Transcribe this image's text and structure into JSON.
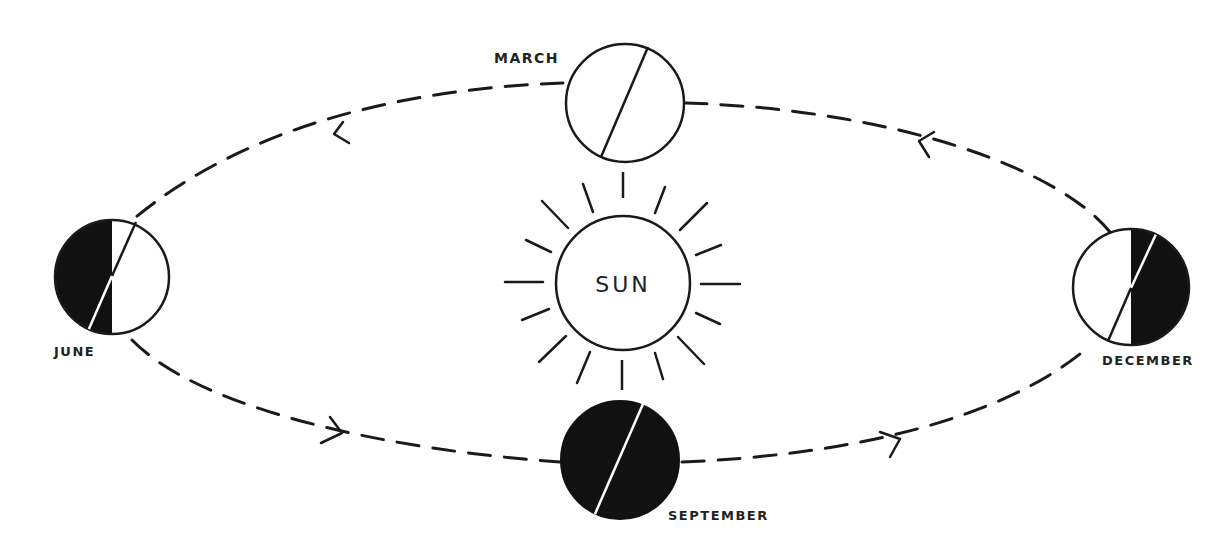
{
  "diagram": {
    "colors": {
      "ink": "#1a1a1a",
      "background": "#ffffff",
      "label": "#222222"
    },
    "sun": {
      "label": "SUN",
      "cx": 623,
      "cy": 283,
      "r": 67,
      "ray_count": 16
    },
    "orbit": {
      "cx": 620,
      "cy": 282,
      "rx": 512,
      "ry": 183,
      "style": "dashed",
      "direction": "counter-clockwise (as drawn: top moves left, bottom moves right)"
    },
    "positions": [
      {
        "id": "march",
        "label": "MARCH",
        "cx": 625,
        "cy": 103,
        "r": 59,
        "shading": "none",
        "axis": [
          [
            648,
            48
          ],
          [
            601,
            157
          ]
        ]
      },
      {
        "id": "june",
        "label": "JUNE",
        "cx": 112,
        "cy": 277,
        "r": 57,
        "shading": "left-half-dark",
        "axis": [
          [
            136,
            222
          ],
          [
            88,
            331
          ]
        ]
      },
      {
        "id": "september",
        "label": "SEPTEMBER",
        "cx": 620,
        "cy": 460,
        "r": 59,
        "shading": "full-dark",
        "axis": [
          [
            643,
            405
          ],
          [
            595,
            513
          ]
        ]
      },
      {
        "id": "december",
        "label": "DECEMBER",
        "cx": 1131,
        "cy": 287,
        "r": 58,
        "shading": "right-half-dark",
        "axis": [
          [
            1157,
            233
          ],
          [
            1108,
            341
          ]
        ]
      }
    ]
  }
}
